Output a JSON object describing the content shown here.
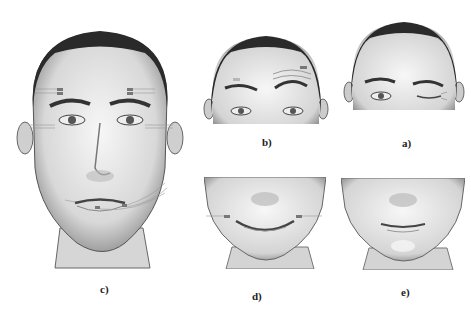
{
  "figure": {
    "panels": [
      {
        "id": "c",
        "label": "c)",
        "description": "Full face front view with electrode sensors on forehead, eye corners and around mouth"
      },
      {
        "id": "b",
        "label": "b)",
        "description": "Upper face with raised eyebrows and forehead wrinkles, sensors on forehead"
      },
      {
        "id": "a",
        "label": "a)",
        "description": "Upper face with one eye winking"
      },
      {
        "id": "d",
        "label": "d)",
        "description": "Lower face smiling with sensors at mouth corners"
      },
      {
        "id": "e",
        "label": "e)",
        "description": "Lower face with pursed smile"
      }
    ],
    "colors": {
      "background": "#ffffff",
      "hair": "#2a2a2a",
      "skin_shadow": "#9a9a9a",
      "skin_light": "#f2f2f2",
      "sensor": "#777777"
    }
  }
}
